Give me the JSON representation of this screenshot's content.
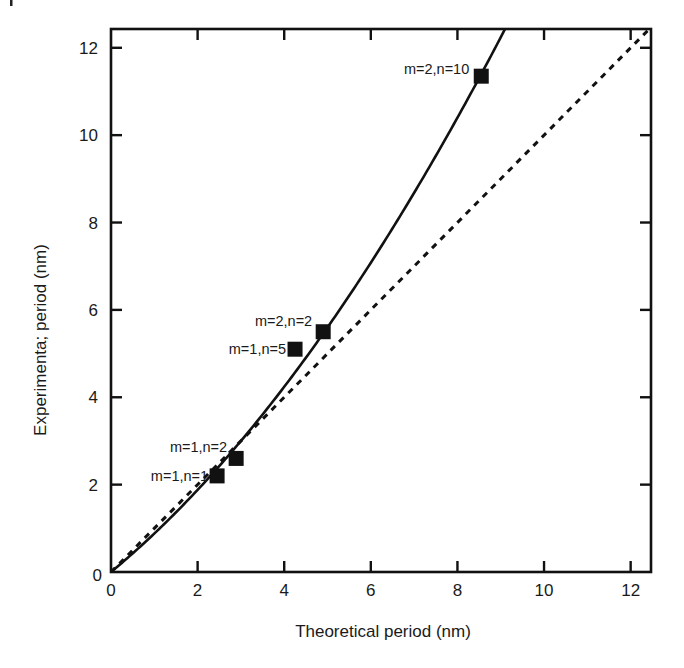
{
  "chart_data": {
    "type": "scatter",
    "title": "",
    "xlabel": "Theoretical period (nm)",
    "ylabel": "Experimenta; period (nm)",
    "xlim": [
      0,
      12.47
    ],
    "ylim": [
      0,
      12.43
    ],
    "xticks": [
      0,
      2,
      4,
      6,
      8,
      10,
      12
    ],
    "yticks": [
      0,
      2,
      4,
      6,
      8,
      10,
      12
    ],
    "grid": false,
    "legend": null,
    "series": [
      {
        "name": "measured",
        "style": "filled-square",
        "points": [
          {
            "x": 2.45,
            "y": 2.2,
            "label": "m=1,n=1"
          },
          {
            "x": 2.89,
            "y": 2.6,
            "label": "m=1,n=2"
          },
          {
            "x": 4.25,
            "y": 5.1,
            "label": "m=1,n=5"
          },
          {
            "x": 4.9,
            "y": 5.5,
            "label": "m=2,n=2"
          },
          {
            "x": 8.55,
            "y": 11.35,
            "label": "m=2,n=10"
          }
        ]
      },
      {
        "name": "fit",
        "style": "solid-line",
        "model": "y = a*x + b*x^2",
        "a": 0.82,
        "b": 0.06
      },
      {
        "name": "y = x",
        "style": "dashed-line",
        "x": [
          0,
          12.47
        ],
        "y": [
          0,
          12.47
        ]
      }
    ]
  },
  "labels": {
    "x_axis_title": "Theoretical period (nm)",
    "y_axis_title": "Experimenta; period (nm)",
    "x_ticks": [
      "0",
      "2",
      "4",
      "6",
      "8",
      "10",
      "12"
    ],
    "y_ticks": [
      "0",
      "2",
      "4",
      "6",
      "8",
      "10",
      "12"
    ]
  },
  "colors": {
    "ink": "#111111",
    "background": "#ffffff"
  }
}
